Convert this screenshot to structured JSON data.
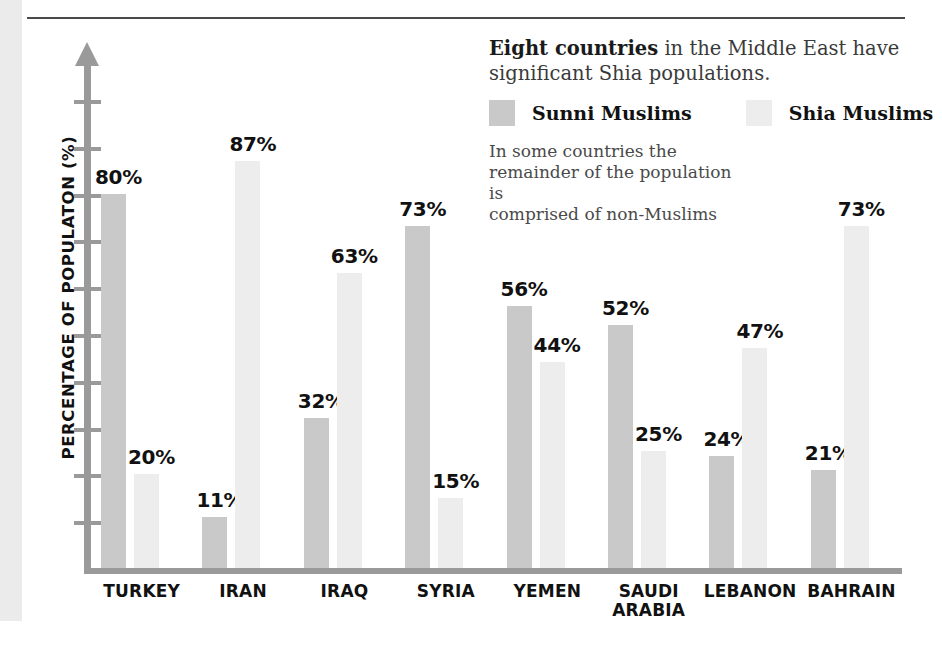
{
  "chart_data": {
    "type": "bar",
    "title": "",
    "xlabel": "",
    "ylabel": "PERCENTAGE OF POPULATON (%)",
    "ylim": [
      0,
      100
    ],
    "grid": false,
    "legend_position": "top-right",
    "categories": [
      "TURKEY",
      "IRAN",
      "IRAQ",
      "SYRIA",
      "YEMEN",
      "SAUDI\nARABIA",
      "LEBANON",
      "BAHRAIN"
    ],
    "series": [
      {
        "name": "Sunni Muslims",
        "color": "#c9c9c9",
        "values": [
          80,
          11,
          32,
          73,
          56,
          52,
          24,
          21
        ],
        "labels": [
          "80%",
          "11%",
          "32%",
          "73%",
          "56%",
          "52%",
          "24%",
          "21%"
        ]
      },
      {
        "name": "Shia Muslims",
        "color": "#ededed",
        "values": [
          20,
          87,
          63,
          15,
          44,
          25,
          47,
          73
        ],
        "labels": [
          "20%",
          "87%",
          "63%",
          "15%",
          "44%",
          "25%",
          "47%",
          "73%"
        ]
      }
    ],
    "annotations": {
      "headline_bold": "Eight countries",
      "headline_rest": " in the Middle East have significant Shia populations.",
      "subnote": "In some countries the\nremainder of the population is\ncomprised of non-Muslims"
    }
  },
  "axis": {
    "tick_count": 10
  }
}
